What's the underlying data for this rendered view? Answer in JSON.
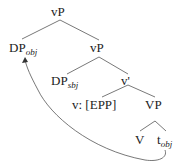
{
  "tree": {
    "root": {
      "label": "vP"
    },
    "dp_obj": {
      "label": "DP",
      "sub": "obj"
    },
    "vp_inner": {
      "label": "vP"
    },
    "dp_subj": {
      "label": "DP",
      "sub": "sbj"
    },
    "v_bar": {
      "label": "v'"
    },
    "v_head": {
      "label": "v: [EPP]"
    },
    "VP": {
      "label": "VP"
    },
    "V": {
      "label": "V"
    },
    "trace": {
      "label": "t",
      "sub": "obj"
    }
  },
  "colors": {
    "line": "#555555",
    "text": "#222222"
  }
}
